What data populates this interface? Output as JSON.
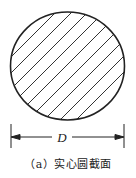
{
  "figure": {
    "shape": "solid circular cross-section",
    "hatch": "diagonal lines",
    "dimension": {
      "label": "D",
      "meaning": "diameter"
    },
    "caption": "（a）实心圆截面"
  },
  "colors": {
    "stroke": "#222222",
    "background": "#ffffff"
  }
}
